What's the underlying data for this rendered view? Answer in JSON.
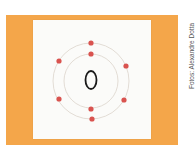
{
  "photo": {
    "background_color": "#f4a64a",
    "card_color": "#fbfbf9",
    "description": "Bohr model of an oxygen atom drawn on a white card over an orange background"
  },
  "atom": {
    "nucleus_symbol": "O",
    "shells": [
      {
        "name": "inner",
        "radius": 23,
        "electrons": 2
      },
      {
        "name": "outer",
        "radius": 37,
        "electrons": 6
      }
    ],
    "electron_color": "#d9534f",
    "orbit_color": "#d8d0c8",
    "nucleus_stroke": "#1a1a1a"
  },
  "credit": {
    "text": "Fotos: Alexandre Dotta"
  }
}
